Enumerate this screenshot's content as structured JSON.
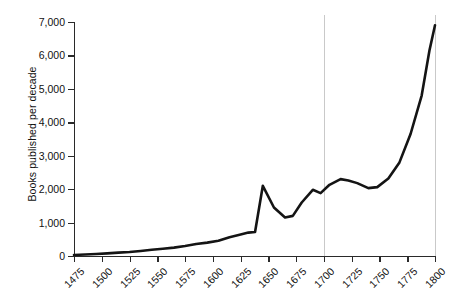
{
  "chart_data": {
    "type": "line",
    "title": "",
    "xlabel": "",
    "ylabel": "Books published per decade",
    "xlim": [
      1475,
      1800
    ],
    "ylim": [
      0,
      7000
    ],
    "grid": "vertical gridlines at 1700 and 1800",
    "gridline_years": [
      1700,
      1800
    ],
    "legend": "none",
    "y_ticks": [
      0,
      1000,
      2000,
      3000,
      4000,
      5000,
      6000,
      7000
    ],
    "y_tick_labels": [
      "0",
      "1,000",
      "2,000",
      "3,000",
      "4,000",
      "5,000",
      "6,000",
      "7,000"
    ],
    "x_ticks": [
      1475,
      1500,
      1525,
      1550,
      1575,
      1600,
      1625,
      1650,
      1675,
      1700,
      1725,
      1750,
      1775,
      1800
    ],
    "x_tick_labels": [
      "1475",
      "1500",
      "1525",
      "1550",
      "1575",
      "1600",
      "1625",
      "1650",
      "1675",
      "1700",
      "1725",
      "1750",
      "1775",
      "1800"
    ],
    "line_color": "#141414",
    "series": [
      {
        "name": "Books published per decade",
        "x": [
          1475,
          1485,
          1495,
          1505,
          1515,
          1525,
          1535,
          1545,
          1555,
          1565,
          1575,
          1585,
          1595,
          1605,
          1615,
          1625,
          1632,
          1638,
          1645,
          1655,
          1665,
          1672,
          1680,
          1690,
          1697,
          1705,
          1715,
          1722,
          1730,
          1740,
          1748,
          1758,
          1768,
          1778,
          1788,
          1795,
          1800
        ],
        "values": [
          30,
          45,
          60,
          80,
          100,
          120,
          150,
          185,
          215,
          250,
          300,
          360,
          400,
          455,
          560,
          640,
          700,
          720,
          2100,
          1450,
          1150,
          1200,
          1600,
          1980,
          1880,
          2130,
          2300,
          2260,
          2180,
          2030,
          2060,
          2320,
          2800,
          3650,
          4800,
          6150,
          6900
        ]
      }
    ]
  },
  "axis": {
    "y_title": "Books published per decade"
  },
  "caption": {
    "text": ""
  }
}
